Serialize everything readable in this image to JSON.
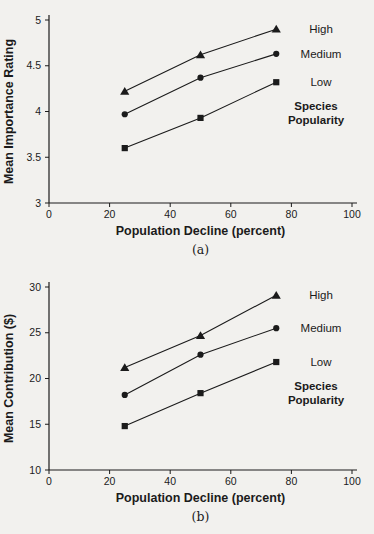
{
  "page": {
    "background_color": "#f2f1ee",
    "ink_color": "#1b1b1b"
  },
  "chart_data": [
    {
      "type": "line",
      "figure_label": "(a)",
      "xlabel": "Population Decline (percent)",
      "ylabel": "Mean Importance Rating",
      "x": [
        25,
        50,
        75
      ],
      "series": [
        {
          "name": "High",
          "marker": "triangle",
          "values": [
            4.22,
            4.62,
            4.9
          ]
        },
        {
          "name": "Medium",
          "marker": "circle",
          "values": [
            3.97,
            4.37,
            4.63
          ]
        },
        {
          "name": "Low",
          "marker": "square",
          "values": [
            3.6,
            3.93,
            4.32
          ]
        }
      ],
      "xlim": [
        0,
        100
      ],
      "ylim": [
        3,
        5
      ],
      "xticks": [
        0,
        20,
        40,
        60,
        80,
        100
      ],
      "yticks": [
        3,
        3.5,
        4,
        4.5,
        5
      ],
      "xtick_labels": [
        "0",
        "20",
        "40",
        "60",
        "80",
        "100"
      ],
      "ytick_labels": [
        "3",
        "3.5",
        "4",
        "4.5",
        "5"
      ],
      "legend_title": [
        "Species",
        "Popularity"
      ],
      "legend_position": "right",
      "grid": false,
      "line_color": "#1b1b1b"
    },
    {
      "type": "line",
      "figure_label": "(b)",
      "xlabel": "Population Decline (percent)",
      "ylabel": "Mean Contribution ($)",
      "x": [
        25,
        50,
        75
      ],
      "series": [
        {
          "name": "High",
          "marker": "triangle",
          "values": [
            21.2,
            24.7,
            29.1
          ]
        },
        {
          "name": "Medium",
          "marker": "circle",
          "values": [
            18.2,
            22.6,
            25.5
          ]
        },
        {
          "name": "Low",
          "marker": "square",
          "values": [
            14.8,
            18.4,
            21.8
          ]
        }
      ],
      "xlim": [
        0,
        100
      ],
      "ylim": [
        10,
        30
      ],
      "xticks": [
        0,
        20,
        40,
        60,
        80,
        100
      ],
      "yticks": [
        10,
        15,
        20,
        25,
        30
      ],
      "xtick_labels": [
        "0",
        "20",
        "40",
        "60",
        "80",
        "100"
      ],
      "ytick_labels": [
        "10",
        "15",
        "20",
        "25",
        "30"
      ],
      "legend_title": [
        "Species",
        "Popularity"
      ],
      "legend_position": "right",
      "grid": false,
      "line_color": "#1b1b1b"
    }
  ]
}
